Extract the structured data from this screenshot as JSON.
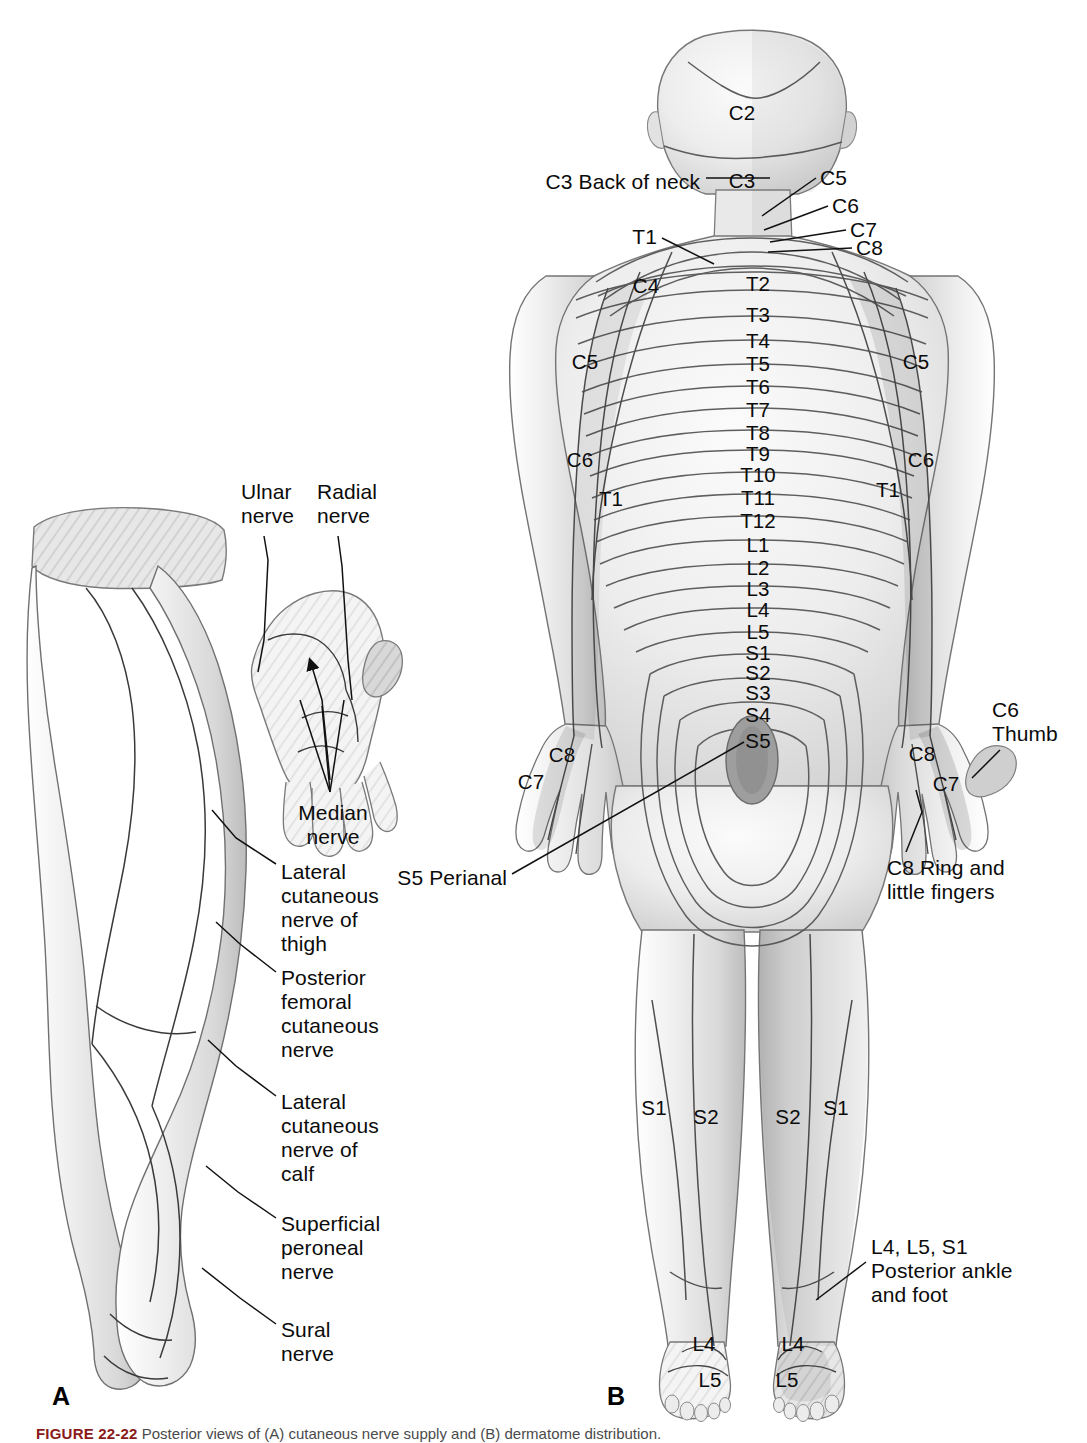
{
  "figure": {
    "panel_a_letter": "A",
    "panel_b_letter": "B",
    "caption_prefix": "FIGURE 22-22",
    "caption_text": "  Posterior views of (A) cutaneous nerve supply and (B) dermatome distribution."
  },
  "colors": {
    "skin_light": "#f2f2f2",
    "skin_mid": "#e2e2e2",
    "skin_dark": "#c9c9c9",
    "skin_darker": "#b4b4b4",
    "outline": "#6e6e6e",
    "line": "#111111",
    "text": "#0b0b0b",
    "caption_accent": "#8a1a1a"
  },
  "panel_a": {
    "title_letter": "A",
    "labels": [
      {
        "id": "ulnar-nerve",
        "text": "Ulnar\nnerve",
        "x": 241,
        "y": 480,
        "align": "left",
        "leader": [
          [
            264,
            536
          ],
          [
            268,
            560
          ],
          [
            264,
            640
          ],
          [
            258,
            672
          ]
        ]
      },
      {
        "id": "radial-nerve",
        "text": "Radial\nnerve",
        "x": 317,
        "y": 480,
        "align": "left",
        "leader": [
          [
            338,
            536
          ],
          [
            342,
            566
          ],
          [
            348,
            660
          ],
          [
            352,
            700
          ]
        ]
      },
      {
        "id": "median-nerve",
        "text": "Median\nnerve",
        "x": 333,
        "y": 801,
        "align": "center",
        "leader": []
      },
      {
        "id": "lateral-cut-thigh",
        "text": "Lateral\ncutaneous\nnerve of\nthigh",
        "x": 281,
        "y": 860,
        "align": "left",
        "leader": [
          [
            276,
            864
          ],
          [
            236,
            838
          ],
          [
            212,
            810
          ]
        ]
      },
      {
        "id": "post-fem-cut",
        "text": "Posterior\nfemoral\ncutaneous\nnerve",
        "x": 281,
        "y": 966,
        "align": "left",
        "leader": [
          [
            276,
            972
          ],
          [
            240,
            944
          ],
          [
            216,
            922
          ]
        ]
      },
      {
        "id": "lateral-cut-calf",
        "text": "Lateral\ncutaneous\nnerve of\ncalf",
        "x": 281,
        "y": 1090,
        "align": "left",
        "leader": [
          [
            276,
            1096
          ],
          [
            236,
            1066
          ],
          [
            208,
            1040
          ]
        ]
      },
      {
        "id": "superficial-peroneal",
        "text": "Superficial\nperoneal\nnerve",
        "x": 281,
        "y": 1212,
        "align": "left",
        "leader": [
          [
            276,
            1218
          ],
          [
            238,
            1192
          ],
          [
            206,
            1166
          ]
        ]
      },
      {
        "id": "sural-nerve",
        "text": "Sural\nnerve",
        "x": 281,
        "y": 1318,
        "align": "left",
        "leader": [
          [
            276,
            1324
          ],
          [
            240,
            1298
          ],
          [
            202,
            1268
          ]
        ]
      }
    ],
    "median_arrow_targets": [
      [
        330,
        780
      ],
      [
        322,
        700
      ],
      [
        310,
        660
      ]
    ],
    "median_fan": [
      [
        330,
        792
      ],
      [
        300,
        700
      ],
      [
        322,
        706
      ],
      [
        344,
        700
      ]
    ]
  },
  "panel_b": {
    "title_letter": "B",
    "spine_segments": [
      {
        "label": "C2",
        "x": 742,
        "y": 101
      },
      {
        "label": "C3",
        "x": 742,
        "y": 169
      },
      {
        "label": "T2",
        "x": 758,
        "y": 272
      },
      {
        "label": "T3",
        "x": 758,
        "y": 303
      },
      {
        "label": "T4",
        "x": 758,
        "y": 329
      },
      {
        "label": "T5",
        "x": 758,
        "y": 352
      },
      {
        "label": "T6",
        "x": 758,
        "y": 375
      },
      {
        "label": "T7",
        "x": 758,
        "y": 398
      },
      {
        "label": "T8",
        "x": 758,
        "y": 421
      },
      {
        "label": "T9",
        "x": 758,
        "y": 442
      },
      {
        "label": "T10",
        "x": 758,
        "y": 463
      },
      {
        "label": "T11",
        "x": 758,
        "y": 486
      },
      {
        "label": "T12",
        "x": 758,
        "y": 509
      },
      {
        "label": "L1",
        "x": 758,
        "y": 533
      },
      {
        "label": "L2",
        "x": 758,
        "y": 556
      },
      {
        "label": "L3",
        "x": 758,
        "y": 577
      },
      {
        "label": "L4",
        "x": 758,
        "y": 598
      },
      {
        "label": "L5",
        "x": 758,
        "y": 620
      },
      {
        "label": "S1",
        "x": 758,
        "y": 641
      },
      {
        "label": "S2",
        "x": 758,
        "y": 661
      },
      {
        "label": "S3",
        "x": 758,
        "y": 681
      },
      {
        "label": "S4",
        "x": 758,
        "y": 703
      },
      {
        "label": "S5",
        "x": 758,
        "y": 729
      }
    ],
    "side_labels": [
      {
        "id": "left-c4",
        "label": "C4",
        "x": 646,
        "y": 274
      },
      {
        "id": "left-c5",
        "label": "C5",
        "x": 585,
        "y": 350
      },
      {
        "id": "left-c6",
        "label": "C6",
        "x": 580,
        "y": 448
      },
      {
        "id": "left-t1",
        "label": "T1",
        "x": 611,
        "y": 487
      },
      {
        "id": "left-c7",
        "label": "C7",
        "x": 531,
        "y": 770
      },
      {
        "id": "left-c8",
        "label": "C8",
        "x": 562,
        "y": 743
      },
      {
        "id": "right-c5",
        "label": "C5",
        "x": 916,
        "y": 350
      },
      {
        "id": "right-c6",
        "label": "C6",
        "x": 921,
        "y": 448
      },
      {
        "id": "right-t1",
        "label": "T1",
        "x": 888,
        "y": 478
      },
      {
        "id": "right-c8",
        "label": "C8",
        "x": 922,
        "y": 742
      },
      {
        "id": "right-c7",
        "label": "C7",
        "x": 946,
        "y": 772
      },
      {
        "id": "left-leg-s1",
        "label": "S1",
        "x": 654,
        "y": 1096
      },
      {
        "id": "left-leg-s2",
        "label": "S2",
        "x": 706,
        "y": 1105
      },
      {
        "id": "right-leg-s2",
        "label": "S2",
        "x": 788,
        "y": 1105
      },
      {
        "id": "right-leg-s1",
        "label": "S1",
        "x": 836,
        "y": 1096
      },
      {
        "id": "left-foot-l4",
        "label": "L4",
        "x": 704,
        "y": 1332
      },
      {
        "id": "left-foot-l5",
        "label": "L5",
        "x": 710,
        "y": 1368
      },
      {
        "id": "right-foot-l4",
        "label": "L4",
        "x": 793,
        "y": 1332
      },
      {
        "id": "right-foot-l5",
        "label": "L5",
        "x": 787,
        "y": 1368
      }
    ],
    "callouts": [
      {
        "id": "c3-back-of-neck",
        "text": "C3 Back of neck",
        "x": 700,
        "y": 170,
        "align": "right",
        "leader": [
          [
            706,
            178
          ],
          [
            770,
            178
          ]
        ]
      },
      {
        "id": "neck-c5",
        "text": "C5",
        "x": 820,
        "y": 166,
        "align": "left",
        "leader": [
          [
            816,
            178
          ],
          [
            762,
            216
          ]
        ]
      },
      {
        "id": "neck-c6",
        "text": "C6",
        "x": 832,
        "y": 194,
        "align": "left",
        "leader": [
          [
            828,
            206
          ],
          [
            764,
            230
          ]
        ]
      },
      {
        "id": "neck-c7",
        "text": "C7",
        "x": 850,
        "y": 218,
        "align": "left",
        "leader": [
          [
            846,
            230
          ],
          [
            770,
            242
          ]
        ]
      },
      {
        "id": "neck-c8",
        "text": "C8",
        "x": 856,
        "y": 236,
        "align": "left",
        "leader": [
          [
            852,
            248
          ],
          [
            768,
            252
          ]
        ]
      },
      {
        "id": "shoulder-t1",
        "text": "T1",
        "x": 657,
        "y": 225,
        "align": "right",
        "leader": [
          [
            662,
            238
          ],
          [
            714,
            264
          ]
        ]
      },
      {
        "id": "s5-perianal",
        "text": "S5 Perianal",
        "x": 507,
        "y": 866,
        "align": "right",
        "leader": [
          [
            512,
            874
          ],
          [
            744,
            742
          ]
        ]
      },
      {
        "id": "c6-thumb",
        "text": "C6\nThumb",
        "x": 992,
        "y": 698,
        "align": "left",
        "leader": [
          [
            1000,
            750
          ],
          [
            972,
            778
          ]
        ]
      },
      {
        "id": "c8-ring-little",
        "text": "C8 Ring and\nlittle fingers",
        "x": 887,
        "y": 856,
        "align": "left",
        "leader": [
          [
            906,
            852
          ],
          [
            922,
            812
          ],
          [
            916,
            790
          ]
        ]
      },
      {
        "id": "l4-l5-s1-ankle",
        "text": "L4, L5, S1\nPosterior ankle\nand foot",
        "x": 871,
        "y": 1235,
        "align": "left",
        "leader": [
          [
            866,
            1262
          ],
          [
            816,
            1300
          ]
        ]
      }
    ]
  }
}
